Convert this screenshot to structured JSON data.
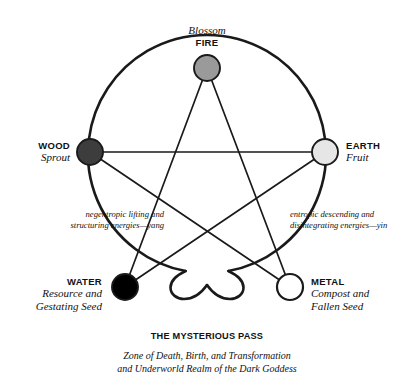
{
  "figure": {
    "background_color": "#ffffff",
    "stroke_color": "#1a1a1a"
  },
  "nodes": [
    {
      "id": "fire",
      "element": "FIRE",
      "phase": "Blossom",
      "fill": "#9a9a9a",
      "cx": 207,
      "cy": 68,
      "r": 13,
      "label_anchor": "above"
    },
    {
      "id": "wood",
      "element": "WOOD",
      "phase": "Sprout",
      "fill": "#3d3d3d",
      "cx": 90,
      "cy": 152,
      "r": 13,
      "label_anchor": "left"
    },
    {
      "id": "earth",
      "element": "EARTH",
      "phase": "Fruit",
      "fill": "#e6e6e6",
      "cx": 325,
      "cy": 152,
      "r": 13,
      "label_anchor": "right"
    },
    {
      "id": "water",
      "element": "WATER",
      "phase": "Resource and Gestating Seed",
      "phase_lines": [
        "Resource and",
        "Gestating Seed"
      ],
      "fill": "#000000",
      "cx": 125,
      "cy": 287,
      "r": 13,
      "label_anchor": "left"
    },
    {
      "id": "metal",
      "element": "METAL",
      "phase": "Compost and Fallen Seed",
      "phase_lines": [
        "Compost and",
        "Fallen Seed"
      ],
      "fill": "#ffffff",
      "cx": 290,
      "cy": 287,
      "r": 13,
      "label_anchor": "right"
    }
  ],
  "annotations": {
    "left": {
      "lines": [
        "negentropic lifting and",
        "structuring energies—yang"
      ],
      "polarity": "yang"
    },
    "right": {
      "lines": [
        "entropic descending and",
        "disintegrating energies—yin"
      ],
      "polarity": "yin"
    }
  },
  "caption": {
    "title": "THE MYSTERIOUS PASS",
    "lines": [
      "Zone of Death, Birth, and Transformation",
      "and Underworld Realm of the Dark Goddess"
    ]
  },
  "mysterious_pass_symbol": "infinity-lemniscate",
  "geometry": {
    "circle_cx": 207,
    "circle_cy": 155,
    "circle_r": 119,
    "star_order": [
      "fire",
      "water",
      "earth",
      "wood",
      "metal"
    ]
  }
}
